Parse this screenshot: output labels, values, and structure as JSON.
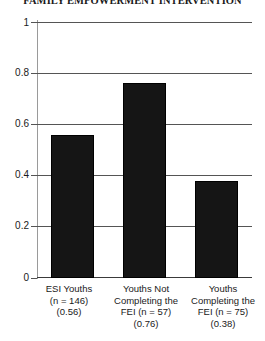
{
  "chart_data": {
    "type": "bar",
    "title": "FAMILY EMPOWERMENT INTERVENTION",
    "xlabel": "",
    "ylabel": "",
    "ylim": [
      0,
      1
    ],
    "grid": true,
    "legend": false,
    "categories": [
      "ESI Youths (n = 146) (0.56)",
      "Youths Not Completing the FEI (n = 57) (0.76)",
      "Youths Completing the FEI (n = 75) (0.38)"
    ],
    "values": [
      0.56,
      0.76,
      0.38
    ],
    "ytick_labels": [
      "0",
      "0.2",
      "0.4",
      "0.6",
      "0.8",
      "1"
    ],
    "ytick_values": [
      0,
      0.2,
      0.4,
      0.6,
      0.8,
      1
    ],
    "bar_color": "#151515"
  },
  "axis": {
    "y_ticks": [
      {
        "label": "1",
        "value": 1
      },
      {
        "label": "0.8",
        "value": 0.8
      },
      {
        "label": "0.6",
        "value": 0.6
      },
      {
        "label": "0.4",
        "value": 0.4
      },
      {
        "label": "0.2",
        "value": 0.2
      },
      {
        "label": "0",
        "value": 0
      }
    ]
  },
  "categories": [
    {
      "line1": "ESI Youths",
      "line2": "(n = 146)",
      "line3": "(0.56)",
      "line4": ""
    },
    {
      "line1": "Youths Not",
      "line2": "Completing the",
      "line3": "FEI (n = 57)",
      "line4": "(0.76)"
    },
    {
      "line1": "Youths",
      "line2": "Completing the",
      "line3": "FEI (n = 75)",
      "line4": "(0.38)"
    }
  ]
}
